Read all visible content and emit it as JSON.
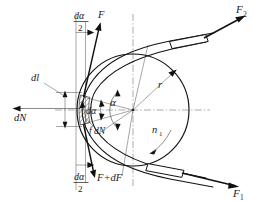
{
  "figure": {
    "type": "engineering-diagram"
  },
  "labels": {
    "force_top": "F",
    "force_bottom_prefix": "F",
    "force_bottom_full": "F+dF",
    "normal_force": "dN",
    "friction_force": "f dN",
    "arc_length": "dl",
    "angle_half_num": "dα",
    "angle_half_den": "2",
    "angle_element": "dα",
    "wrap_angle": "α",
    "radius": "r",
    "rotation_speed": "n",
    "rotation_speed_sub": "1",
    "tension_slack": "F",
    "tension_slack_sub": "1",
    "tension_tight": "F",
    "tension_tight_sub": "2",
    "plus_sign": "+",
    "d_char": "d"
  },
  "colors": {
    "ink": "#111111",
    "thin_ink": "#2b2b2b",
    "center_line": "#555555",
    "background": "#ffffff"
  },
  "geometry": {
    "center_x": 133,
    "center_y": 110,
    "radius_px": 56,
    "wrap_angle_deg": 48
  }
}
